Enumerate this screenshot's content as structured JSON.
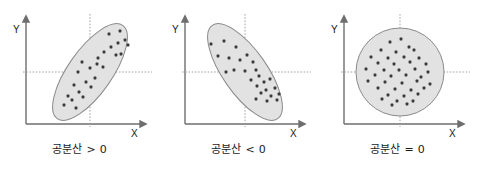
{
  "figure": {
    "title": "",
    "background_color": "#ffffff",
    "panel_count": 3
  },
  "style": {
    "axis_color": "#6e6e6e",
    "ellipse_fill": "#e2e2e2",
    "ellipse_stroke": "#8a8a8a",
    "dot_color": "#3a3a3a",
    "guide_line_color": "#9a9a9a",
    "label_color": "#1a1a1a",
    "caption_color": "#1a1a1a"
  },
  "panels": [
    {
      "id": "panel-positive",
      "caption": "공분산 > 0",
      "y_axis_label": "Y",
      "x_axis_label": "X",
      "shape": "ellipse",
      "origin": {
        "x": 90,
        "y": 72
      },
      "chart_data": {
        "type": "scatter",
        "title": "공분산 > 0",
        "xlabel": "X",
        "ylabel": "Y",
        "relationship": "positive",
        "grid": false,
        "legend": "none",
        "xlim": [
          0,
          159
        ],
        "ylim": [
          0,
          130
        ],
        "envelope": {
          "type": "ellipse",
          "cx": 90,
          "cy": 72,
          "rx": 22,
          "ry": 57,
          "rotation_deg": 35
        },
        "points": [
          [
            109,
            34
          ],
          [
            120,
            31
          ],
          [
            125,
            40
          ],
          [
            118,
            43
          ],
          [
            128,
            45
          ],
          [
            111,
            47
          ],
          [
            104,
            52
          ],
          [
            116,
            55
          ],
          [
            121,
            54
          ],
          [
            98,
            58
          ],
          [
            97,
            64
          ],
          [
            82,
            62
          ],
          [
            90,
            68
          ],
          [
            103,
            67
          ],
          [
            78,
            72
          ],
          [
            95,
            78
          ],
          [
            86,
            82
          ],
          [
            74,
            85
          ],
          [
            91,
            87
          ],
          [
            79,
            92
          ],
          [
            68,
            96
          ],
          [
            83,
            97
          ],
          [
            72,
            100
          ],
          [
            64,
            105
          ],
          [
            76,
            108
          ]
        ]
      }
    },
    {
      "id": "panel-negative",
      "caption": "공분산 < 0",
      "y_axis_label": "Y",
      "x_axis_label": "X",
      "shape": "ellipse",
      "origin": {
        "x": 86,
        "y": 72
      },
      "chart_data": {
        "type": "scatter",
        "title": "공분산 < 0",
        "xlabel": "X",
        "ylabel": "Y",
        "relationship": "negative",
        "grid": false,
        "legend": "none",
        "xlim": [
          0,
          159
        ],
        "ylim": [
          0,
          130
        ],
        "envelope": {
          "type": "ellipse",
          "cx": 86,
          "cy": 72,
          "rx": 22,
          "ry": 57,
          "rotation_deg": -35
        },
        "points": [
          [
            52,
            44
          ],
          [
            65,
            41
          ],
          [
            77,
            47
          ],
          [
            59,
            56
          ],
          [
            70,
            58
          ],
          [
            81,
            60
          ],
          [
            88,
            55
          ],
          [
            94,
            62
          ],
          [
            75,
            70
          ],
          [
            86,
            71
          ],
          [
            97,
            70
          ],
          [
            67,
            72
          ],
          [
            100,
            76
          ],
          [
            92,
            80
          ],
          [
            105,
            82
          ],
          [
            111,
            79
          ],
          [
            98,
            86
          ],
          [
            107,
            90
          ],
          [
            116,
            88
          ],
          [
            102,
            93
          ],
          [
            112,
            96
          ],
          [
            120,
            94
          ],
          [
            97,
            99
          ],
          [
            108,
            101
          ],
          [
            118,
            100
          ]
        ]
      }
    },
    {
      "id": "panel-zero",
      "caption": "공분산 = 0",
      "y_axis_label": "Y",
      "x_axis_label": "X",
      "shape": "circle",
      "origin": {
        "x": 82,
        "y": 72
      },
      "chart_data": {
        "type": "scatter",
        "title": "공분산 = 0",
        "xlabel": "X",
        "ylabel": "Y",
        "relationship": "none",
        "grid": false,
        "legend": "none",
        "xlim": [
          0,
          159
        ],
        "ylim": [
          0,
          130
        ],
        "envelope": {
          "type": "circle",
          "cx": 82,
          "cy": 72,
          "rx": 44,
          "ry": 44,
          "rotation_deg": 0
        },
        "points": [
          [
            72,
            42
          ],
          [
            83,
            39
          ],
          [
            91,
            47
          ],
          [
            63,
            50
          ],
          [
            78,
            52
          ],
          [
            96,
            50
          ],
          [
            53,
            57
          ],
          [
            70,
            58
          ],
          [
            86,
            57
          ],
          [
            101,
            58
          ],
          [
            60,
            63
          ],
          [
            76,
            64
          ],
          [
            92,
            62
          ],
          [
            108,
            64
          ],
          [
            48,
            69
          ],
          [
            66,
            70
          ],
          [
            81,
            70
          ],
          [
            97,
            69
          ],
          [
            110,
            72
          ],
          [
            57,
            75
          ],
          [
            73,
            76
          ],
          [
            88,
            75
          ],
          [
            103,
            77
          ],
          [
            50,
            81
          ],
          [
            67,
            82
          ],
          [
            84,
            83
          ],
          [
            99,
            81
          ],
          [
            112,
            84
          ],
          [
            60,
            88
          ],
          [
            77,
            89
          ],
          [
            93,
            90
          ],
          [
            106,
            88
          ],
          [
            70,
            95
          ],
          [
            86,
            96
          ],
          [
            100,
            94
          ],
          [
            79,
            101
          ],
          [
            64,
            99
          ],
          [
            95,
            101
          ],
          [
            74,
            105
          ],
          [
            89,
            104
          ]
        ]
      }
    }
  ]
}
